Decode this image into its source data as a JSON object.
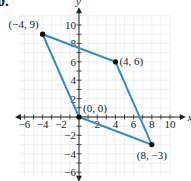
{
  "problem_number": "60.",
  "chart_data": {
    "type": "scatter",
    "title": "",
    "xlabel": "x",
    "ylabel": "y",
    "xlim": [
      -6,
      10
    ],
    "ylim": [
      -6,
      10
    ],
    "grid": true,
    "x_ticks": [
      -6,
      -4,
      -2,
      2,
      4,
      6,
      8,
      10
    ],
    "y_ticks": [
      -6,
      -4,
      -2,
      2,
      4,
      6,
      8,
      10
    ],
    "x_tick_labels": [
      "−6",
      "−4",
      "−2",
      "2",
      "4",
      "6",
      "8",
      "10"
    ],
    "y_tick_labels": [
      "−6",
      "−4",
      "−2",
      "2",
      "4",
      "6",
      "8",
      "10"
    ],
    "points": [
      {
        "x": -4,
        "y": 9,
        "label": "(−4, 9)"
      },
      {
        "x": 4,
        "y": 6,
        "label": "(4, 6)"
      },
      {
        "x": 0,
        "y": 0,
        "label": "(0, 0)"
      },
      {
        "x": 8,
        "y": -3,
        "label": "(8, −3)"
      }
    ],
    "polygon": [
      [
        -4,
        9
      ],
      [
        4,
        6
      ],
      [
        8,
        -3
      ],
      [
        0,
        0
      ]
    ],
    "line_color": "#2e8bc9",
    "point_color": "#000000"
  }
}
